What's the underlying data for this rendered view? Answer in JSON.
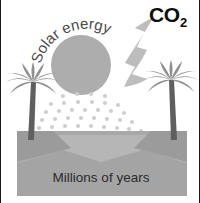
{
  "figure": {
    "width": 200,
    "height": 203,
    "background": "#ffffff",
    "border_color": "#1a1a1a"
  },
  "labels": {
    "solar_energy": "Solar energy",
    "co2_formula": "CO",
    "co2_subscript": "2",
    "co2_full": "CO2",
    "millions_of_years": "Millions of years"
  },
  "colors": {
    "sun": "#adadad",
    "arrow": "#bdbdbd",
    "palm": "#8f8f8f",
    "palm_trunk": "#5a5a5a",
    "ground_bank": "#9b9b9b",
    "ground_basin": "#b4b4b4",
    "ground_base": "#a8a8a8",
    "dots": "#cfcfcf",
    "text_dark": "#2b2b2b",
    "text_gray": "#4a4a4a",
    "co2_text": "#0d0d0d",
    "page_background": "#ffffff"
  },
  "scene": {
    "sun": {
      "cx": 80,
      "cy": 65,
      "r": 30
    },
    "arrow": {
      "label": "co2-down-arrow",
      "direction": "down-left"
    },
    "palm_left": {
      "x": 28,
      "ground_y": 136
    },
    "palm_right": {
      "x": 170,
      "ground_y": 136
    },
    "ground": {
      "top": 131,
      "bottom": 196,
      "left": 16,
      "right": 186
    },
    "energy_dots": {
      "count": 34,
      "description": "fan of small light-gray dots radiating downward from the sun"
    }
  },
  "icons": {
    "sun": "sun-icon",
    "arrow": "down-arrow-icon",
    "palm_left": "palm-tree-icon",
    "palm_right": "palm-tree-icon",
    "dots": "energy-dots-icon"
  }
}
